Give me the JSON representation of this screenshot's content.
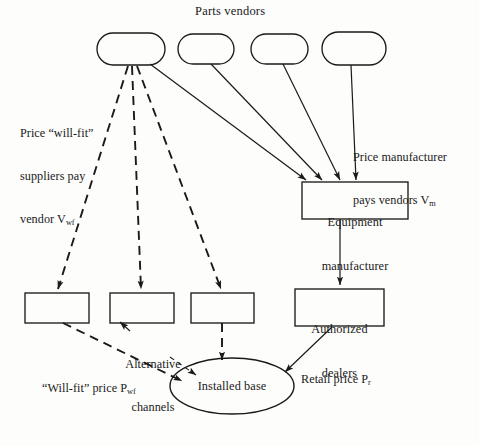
{
  "diagram": {
    "title": "Parts vendors",
    "nodes": {
      "vendor_1": "",
      "vendor_2": "",
      "vendor_3": "",
      "vendor_4": "",
      "equipment_manufacturer": "Equipment\nmanufacturer",
      "equipment_manufacturer_line1": "Equipment",
      "equipment_manufacturer_line2": "manufacturer",
      "channel_1": "",
      "channel_2": "",
      "channel_3": "",
      "authorized_dealers_line1": "Authorized",
      "authorized_dealers_line2": "dealers",
      "installed_base": "Installed base"
    },
    "annotations": {
      "will_fit_price_line1": "Price “will-fit”",
      "will_fit_price_line2": "suppliers pay",
      "will_fit_price_line3_pre": "vendor V",
      "will_fit_price_line3_sub": "wf",
      "manufacturer_price_line1": "Price manufacturer",
      "manufacturer_price_line2_pre": "pays vendors V",
      "manufacturer_price_line2_sub": "m",
      "alternative_channels_line1": "Alternative",
      "alternative_channels_line2": "channels",
      "will_fit_bottom_pre": "“Will-fit” price P",
      "will_fit_bottom_sub": "wf",
      "retail_price_pre": "Retail price P",
      "retail_price_sub": "r"
    },
    "colors": {
      "stroke": "#1a1a1a",
      "background": "#fdfdfc",
      "text": "#1a1a1a"
    }
  }
}
